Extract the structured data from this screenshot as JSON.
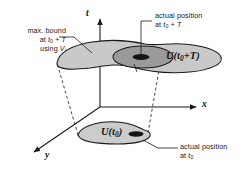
{
  "figure": {
    "background_color": "#ffffff",
    "stroke_color": "#1a1a1a",
    "fill_outer": "#c9c9c9",
    "fill_inner": "#9a9a9a",
    "fill_dot": "#151515"
  },
  "axes": {
    "t_label": "t",
    "x_label": "x",
    "y_label": "y"
  },
  "annotations": {
    "max_bound": {
      "line1": "max. bound",
      "line2_pre": "at ",
      "line2_t": "t",
      "line2_sub": "0",
      "line2_post": " + T",
      "line3_pre": "using ",
      "line3_v": "V",
      "line3_sub": "i"
    },
    "actual_position_top": {
      "line1": "actual position",
      "line2_pre": "at ",
      "line2_t": "t",
      "line2_sub": "0",
      "line2_post": " + T"
    },
    "actual_position_bottom": {
      "line1": "actual position",
      "line2_pre": "at ",
      "line2_t": "t",
      "line2_sub": "0"
    }
  },
  "sets": {
    "upper": {
      "label_pre": "U(",
      "label_t": "t",
      "label_sub": "0",
      "label_post": "+T)"
    },
    "lower": {
      "label_pre": "U(",
      "label_t": "t",
      "label_sub": "0",
      "label_post": ")"
    }
  }
}
